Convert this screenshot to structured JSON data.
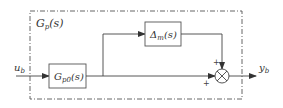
{
  "diagram": {
    "type": "block-diagram",
    "colors": {
      "line": "#444444",
      "text": "#333333",
      "background": "#ffffff"
    },
    "plant_boundary": {
      "label_main": "G",
      "label_sub": "p",
      "label_arg": "(s)",
      "style": "dash-dot"
    },
    "input": {
      "label_main": "u",
      "label_sub": "b"
    },
    "output": {
      "label_main": "y",
      "label_sub": "b"
    },
    "blocks": [
      {
        "id": "nominal",
        "label_main": "G",
        "label_sub": "p0",
        "label_arg": "(s)"
      },
      {
        "id": "uncertainty",
        "label_main": "Δ",
        "label_sub": "m",
        "label_arg": "(s)"
      }
    ],
    "summing_junction": {
      "symbol": "⊗",
      "inputs": [
        {
          "from": "uncertainty",
          "sign": "+"
        },
        {
          "from": "nominal",
          "sign": "+"
        }
      ]
    },
    "edges": [
      {
        "from": "input",
        "to": "nominal"
      },
      {
        "from": "nominal",
        "to": "uncertainty"
      },
      {
        "from": "nominal",
        "to": "summing_junction"
      },
      {
        "from": "uncertainty",
        "to": "summing_junction"
      },
      {
        "from": "summing_junction",
        "to": "output"
      }
    ]
  }
}
